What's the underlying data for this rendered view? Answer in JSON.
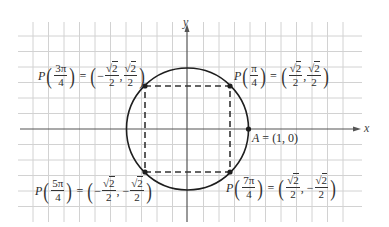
{
  "diagram": {
    "type": "unit-circle",
    "axes": {
      "x_label": "x",
      "y_label": "y"
    },
    "colors": {
      "grid": "#cfcfcf",
      "axis": "#555555",
      "circle": "#1e1e1e",
      "dashed_square": "#333333",
      "points": "#1e1e1e"
    },
    "circle": {
      "center": [
        0,
        0
      ],
      "radius": 1
    },
    "points": [
      {
        "id": "A",
        "label_name": "A",
        "equals": "=",
        "value": "(1, 0)",
        "coords": [
          1,
          0
        ]
      },
      {
        "id": "P_pi_4",
        "P": "P",
        "angle_num": "π",
        "angle_den": "4",
        "equals": "=",
        "x_sign": "",
        "x_num": "2",
        "x_den": "2",
        "y_sign": "",
        "y_num": "2",
        "y_den": "2",
        "coords": [
          "√2/2",
          "√2/2"
        ]
      },
      {
        "id": "P_3pi_4",
        "P": "P",
        "angle_num": "3π",
        "angle_den": "4",
        "equals": "=",
        "x_sign": "−",
        "x_num": "2",
        "x_den": "2",
        "y_sign": "",
        "y_num": "2",
        "y_den": "2",
        "coords": [
          "−√2/2",
          "√2/2"
        ]
      },
      {
        "id": "P_5pi_4",
        "P": "P",
        "angle_num": "5π",
        "angle_den": "4",
        "equals": "=",
        "x_sign": "−",
        "x_num": "2",
        "x_den": "2",
        "y_sign": "−",
        "y_num": "2",
        "y_den": "2",
        "coords": [
          "−√2/2",
          "−√2/2"
        ]
      },
      {
        "id": "P_7pi_4",
        "P": "P",
        "angle_num": "7π",
        "angle_den": "4",
        "equals": "=",
        "x_sign": "",
        "x_num": "2",
        "x_den": "2",
        "y_sign": "−",
        "y_num": "2",
        "y_den": "2",
        "coords": [
          "√2/2",
          "−√2/2"
        ]
      }
    ],
    "symbols": {
      "sqrt": "√",
      "lparen": "(",
      "rparen": ")",
      "comma": ","
    }
  }
}
